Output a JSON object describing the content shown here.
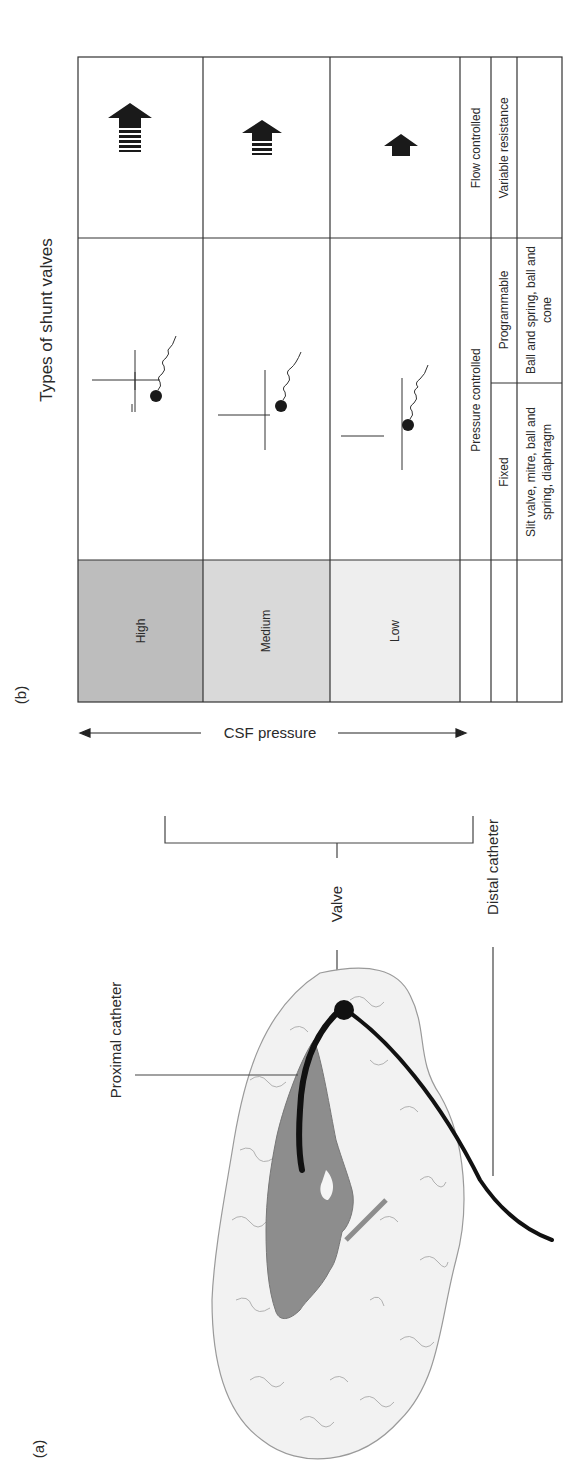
{
  "figure": {
    "panel_a_label": "(a)",
    "panel_b_label": "(b)",
    "rotation": "90deg counter-clockwise"
  },
  "panel_a": {
    "labels": {
      "proximal_catheter": "Proximal catheter",
      "valve": "Valve",
      "distal_catheter": "Distal catheter"
    }
  },
  "panel_b": {
    "title": "Types of shunt valves",
    "axis_label": "CSF pressure",
    "pressure_levels": [
      {
        "label": "High",
        "shade": "#bdbdbd"
      },
      {
        "label": "Medium",
        "shade": "#d9d9d9"
      },
      {
        "label": "Low",
        "shade": "#ececec"
      }
    ],
    "flow_arrow_icons": [
      "high-flow-arrow-icon",
      "medium-flow-arrow-icon",
      "low-flow-arrow-icon"
    ],
    "mechanism_icons": [
      "ball-spring-valve-icon",
      "ball-spring-valve-icon",
      "ball-spring-valve-icon"
    ],
    "categories": {
      "pressure_controlled": "Pressure controlled",
      "flow_controlled": "Flow controlled",
      "fixed": "Fixed",
      "programmable": "Programmable",
      "variable_resistance": "Variable resistance",
      "fixed_examples": [
        "Slit valve, mitre, ball and",
        "spring, diaphragm"
      ],
      "programmable_examples": [
        "Ball and spring, ball and",
        "cone"
      ]
    }
  }
}
